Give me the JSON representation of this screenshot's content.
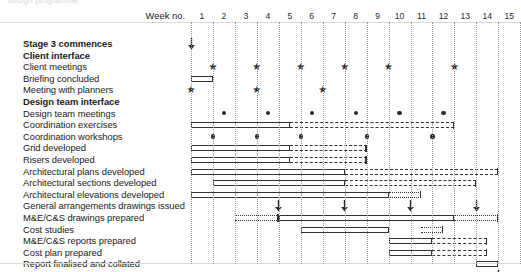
{
  "meta": {
    "top_clipped_text": "design programme",
    "header_week_label": "Week no.",
    "week_numbers": [
      "1",
      "2",
      "3",
      "4",
      "5",
      "6",
      "7",
      "8",
      "9",
      "10",
      "11",
      "12",
      "13",
      "14",
      "15"
    ],
    "accent_color": "#333333",
    "grid_color": "#9a9a9a",
    "background": "#ffffff"
  },
  "chart_data": {
    "type": "bar",
    "xlabel": "Week no.",
    "ylabel": "",
    "xlim": [
      1,
      16
    ],
    "grid": true,
    "legend": "none",
    "categories": [
      "Stage 3 commences",
      "Client interface",
      "Client meetings",
      "Briefing concluded",
      "Meeting with planners",
      "Design team interface",
      "Design team meetings",
      "Coordination exercises",
      "Coordination workshops",
      "Grid developed",
      "Risers developed",
      "Architectural plans developed",
      "Architectural sections developed",
      "Architectural elevations developed",
      "General arrangements drawings issued",
      "M&E/C&S drawings prepared",
      "Cost studies",
      "M&E/C&S reports prepared",
      "Cost plan prepared",
      "Report finalised and collated",
      "Report submitted to client"
    ],
    "rows": [
      {
        "label": "Stage 3 commences",
        "bold": true,
        "bars": [],
        "stars": [],
        "dots": [],
        "arrows": [
          1.0
        ]
      },
      {
        "label": "Client interface",
        "bold": true,
        "bars": [],
        "stars": [],
        "dots": [],
        "arrows": []
      },
      {
        "label": "Client meetings",
        "bold": false,
        "bars": [],
        "stars": [
          2.0,
          4.0,
          6.0,
          8.0,
          10.0,
          13.0
        ],
        "dots": [],
        "arrows": []
      },
      {
        "label": "Briefing concluded",
        "bold": false,
        "bars": [
          {
            "start": 1.0,
            "end": 2.0,
            "style": "solid"
          }
        ],
        "stars": [],
        "dots": [],
        "arrows": []
      },
      {
        "label": "Meeting with planners",
        "bold": false,
        "bars": [],
        "stars": [
          1.0,
          4.0,
          7.0
        ],
        "dots": [],
        "arrows": []
      },
      {
        "label": "Design team interface",
        "bold": true,
        "bars": [],
        "stars": [],
        "dots": [],
        "arrows": []
      },
      {
        "label": "Design team meetings",
        "bold": false,
        "bars": [],
        "stars": [],
        "dots": [
          2.5,
          4.5,
          6.5,
          8.5,
          10.5,
          12.5
        ],
        "arrows": []
      },
      {
        "label": "Coordination exercises",
        "bold": false,
        "bars": [
          {
            "start": 1.0,
            "end": 5.5,
            "style": "solid"
          },
          {
            "start": 5.5,
            "end": 13.0,
            "style": "dashed"
          }
        ],
        "stars": [],
        "dots": [],
        "arrows": []
      },
      {
        "label": "Coordination workshops",
        "bold": false,
        "bars": [],
        "stars": [],
        "dots": [
          2.0,
          4.0,
          6.0,
          9.0,
          12.0
        ],
        "arrows": []
      },
      {
        "label": "Grid developed",
        "bold": false,
        "bars": [
          {
            "start": 1.0,
            "end": 5.5,
            "style": "solid"
          },
          {
            "start": 5.5,
            "end": 9.0,
            "style": "dashed"
          }
        ],
        "stars": [],
        "dots": [],
        "arrows": []
      },
      {
        "label": "Risers developed",
        "bold": false,
        "bars": [
          {
            "start": 1.0,
            "end": 5.5,
            "style": "solid"
          },
          {
            "start": 5.5,
            "end": 9.0,
            "style": "dashed"
          }
        ],
        "stars": [],
        "dots": [],
        "arrows": []
      },
      {
        "label": "Architectural plans developed",
        "bold": false,
        "bars": [
          {
            "start": 1.0,
            "end": 8.0,
            "style": "solid"
          },
          {
            "start": 8.0,
            "end": 15.0,
            "style": "dashed"
          }
        ],
        "stars": [],
        "dots": [],
        "arrows": []
      },
      {
        "label": "Architectural sections developed",
        "bold": false,
        "bars": [
          {
            "start": 2.0,
            "end": 8.0,
            "style": "solid"
          },
          {
            "start": 8.0,
            "end": 14.0,
            "style": "dashed"
          }
        ],
        "stars": [],
        "dots": [],
        "arrows": []
      },
      {
        "label": "Architectural elevations developed",
        "bold": false,
        "bars": [
          {
            "start": 1.0,
            "end": 10.0,
            "style": "solid"
          },
          {
            "start": 10.0,
            "end": 11.5,
            "style": "dotted"
          }
        ],
        "stars": [],
        "dots": [],
        "arrows": []
      },
      {
        "label": "General arrangements drawings issued",
        "bold": false,
        "bars": [],
        "stars": [],
        "dots": [],
        "arrows": [
          5.0,
          8.0,
          11.0,
          14.0
        ]
      },
      {
        "label": "M&E/C&S drawings prepared",
        "bold": false,
        "bars": [
          {
            "start": 3.0,
            "end": 5.0,
            "style": "dotted"
          },
          {
            "start": 5.0,
            "end": 13.0,
            "style": "solid"
          },
          {
            "start": 13.0,
            "end": 15.0,
            "style": "dotted"
          }
        ],
        "stars": [],
        "dots": [],
        "arrows": []
      },
      {
        "label": "Cost studies",
        "bold": false,
        "bars": [
          {
            "start": 6.0,
            "end": 10.0,
            "style": "solid"
          },
          {
            "start": 11.5,
            "end": 12.5,
            "style": "dotted"
          }
        ],
        "stars": [],
        "dots": [],
        "arrows": []
      },
      {
        "label": "M&E/C&S reports prepared",
        "bold": false,
        "bars": [
          {
            "start": 10.0,
            "end": 12.0,
            "style": "solid"
          },
          {
            "start": 12.0,
            "end": 14.5,
            "style": "dashed"
          }
        ],
        "stars": [],
        "dots": [],
        "arrows": []
      },
      {
        "label": "Cost plan prepared",
        "bold": false,
        "bars": [
          {
            "start": 10.0,
            "end": 12.0,
            "style": "solid"
          },
          {
            "start": 12.0,
            "end": 14.5,
            "style": "dashed"
          }
        ],
        "stars": [],
        "dots": [],
        "arrows": []
      },
      {
        "label": "Report finalised and collated",
        "bold": false,
        "bars": [
          {
            "start": 14.0,
            "end": 15.0,
            "style": "solid"
          }
        ],
        "stars": [],
        "dots": [],
        "arrows": []
      },
      {
        "label": "Report submitted to client",
        "bold": false,
        "bars": [],
        "stars": [],
        "dots": [],
        "arrows": [
          15.0
        ]
      }
    ],
    "marker_legend": {
      "star": "meeting / milestone event",
      "dot": "recurring meeting",
      "arrow": "issue / drop point",
      "solid_bar": "planned activity",
      "dashed_bar": "provisional / continuing activity",
      "dotted_bar": "tentative activity"
    }
  }
}
